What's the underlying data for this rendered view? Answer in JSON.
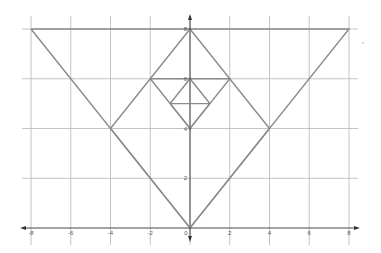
{
  "figure": {
    "type": "coordinate-grid-geometry",
    "x_ticks": [
      "-8",
      "-6",
      "-4",
      "-2",
      "0",
      "2",
      "4",
      "6",
      "8"
    ],
    "y_ticks": [
      "2",
      "4",
      "6",
      "8"
    ],
    "origin_label": "0",
    "colors": {
      "grid": "#b5b5b5",
      "axis": "#333333",
      "shape": "#8a8a8a",
      "background": "#ffffff"
    }
  },
  "chart_data": {
    "type": "line",
    "title": "",
    "xlabel": "",
    "ylabel": "",
    "xlim": [
      -8,
      8
    ],
    "ylim": [
      0,
      8
    ],
    "grid": true,
    "x_ticks": [
      -8,
      -6,
      -4,
      -2,
      0,
      2,
      4,
      6,
      8
    ],
    "y_ticks": [
      2,
      4,
      6,
      8
    ],
    "series": [
      {
        "name": "outer-triangle",
        "points": [
          [
            -8,
            8
          ],
          [
            0,
            0
          ],
          [
            8,
            8
          ],
          [
            -8,
            8
          ]
        ]
      },
      {
        "name": "large-diamond",
        "points": [
          [
            0,
            8
          ],
          [
            4,
            4
          ],
          [
            0,
            0
          ],
          [
            -4,
            4
          ],
          [
            0,
            8
          ]
        ]
      },
      {
        "name": "medium-diamond",
        "points": [
          [
            -2,
            6
          ],
          [
            2,
            6
          ],
          [
            0,
            4
          ],
          [
            -2,
            6
          ]
        ]
      },
      {
        "name": "small-diamond",
        "points": [
          [
            0,
            6
          ],
          [
            1,
            5
          ],
          [
            0,
            4
          ],
          [
            -1,
            5
          ],
          [
            0,
            6
          ]
        ]
      },
      {
        "name": "small-diamond-midline",
        "points": [
          [
            -1,
            5
          ],
          [
            1,
            5
          ]
        ]
      }
    ]
  }
}
